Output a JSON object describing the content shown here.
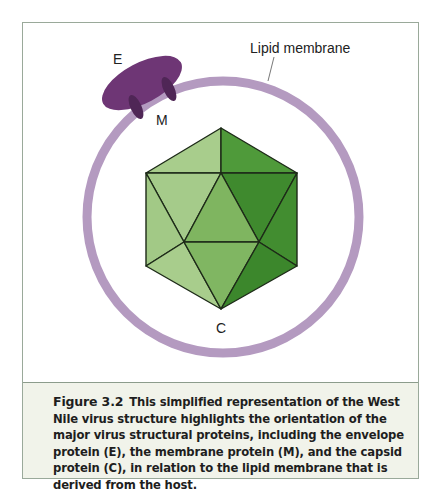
{
  "figure": {
    "labels": {
      "lipid_membrane": "Lipid membrane",
      "envelope": "E",
      "membrane_protein": "M",
      "capsid": "C"
    },
    "colors": {
      "membrane": "#b49ac0",
      "envelope_protein": "#6e3675",
      "membrane_protein": "#4f2656",
      "capsid_light": "#a8cd8c",
      "capsid_mid": "#7fb560",
      "capsid_dark": "#3f8a2e",
      "frame_border": "#9aa99a",
      "caption_bg": "#f1f3ea"
    }
  },
  "caption": {
    "figure_number": "Figure 3.2",
    "text": "This simplified representation of the West Nile virus structure highlights the orientation of the major virus structural proteins, including the envelope protein (E), the membrane protein (M), and the capsid protein (C), in relation to the lipid membrane that is derived from the host."
  }
}
